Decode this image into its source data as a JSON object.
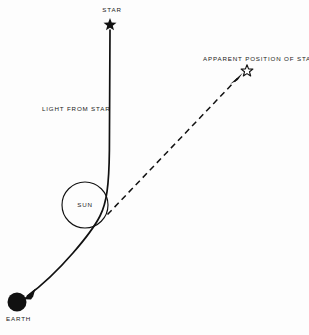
{
  "figure": {
    "background_color": "#fdfdfd",
    "ink_color": "#111111",
    "width": 309,
    "height": 335
  },
  "labels": {
    "star": "STAR",
    "apparent_position": "APPARENT POSITION OF STAR",
    "light_from_star": "LIGHT FROM STAR",
    "sun": "SUN",
    "earth": "EARTH"
  },
  "markers": {
    "star": {
      "icon": "filled-star-icon",
      "x": 110,
      "y": 24,
      "size": 11,
      "fill": "#111111"
    },
    "apparent_star": {
      "icon": "outline-star-icon",
      "x": 247,
      "y": 70,
      "size": 10,
      "fill": "none",
      "stroke": "#111111"
    },
    "sun": {
      "icon": "sun-circle-icon",
      "x": 85,
      "y": 205,
      "radius": 23,
      "fill": "none",
      "stroke": "#111111"
    },
    "earth": {
      "icon": "earth-disk-icon",
      "x": 17,
      "y": 302,
      "radius": 9.5,
      "fill": "#111111"
    }
  },
  "paths": {
    "light_ray": {
      "style": "solid",
      "description": "Curved light ray from star, bending around the Sun, arriving at Earth",
      "arrowhead_at": "earth",
      "stroke_width": 1.6
    },
    "apparent_line": {
      "style": "dashed",
      "description": "Straight dashed sight line from the deflection point to the apparent position of the star",
      "arrowhead_at": "apparent_position",
      "stroke_width": 1.5,
      "dash_pattern": "6 4"
    }
  }
}
